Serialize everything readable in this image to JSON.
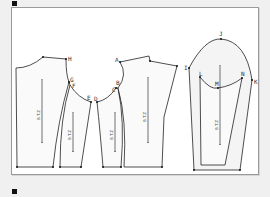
{
  "diagram": {
    "type": "sewing-pattern",
    "pieces": [
      {
        "name": "back",
        "points": [
          "H"
        ],
        "grain_label": "B.T.Z"
      },
      {
        "name": "side-back",
        "points": [
          "G",
          "F",
          "E"
        ],
        "grain_label": "B.T.Z"
      },
      {
        "name": "side-front",
        "points": [
          "D",
          "C"
        ],
        "grain_label": "B.T.Z"
      },
      {
        "name": "front",
        "points": [
          "A",
          "B"
        ],
        "grain_label": "B.T.Z"
      },
      {
        "name": "sleeve",
        "points": [
          "I",
          "J",
          "K",
          "L",
          "M",
          "N"
        ],
        "grain_label": "B.T.Z"
      }
    ],
    "labels": {
      "A": "A",
      "B": "B",
      "C": "C",
      "D": "D",
      "E": "E",
      "F": "F",
      "G": "G",
      "H": "H",
      "I": "I",
      "J": "J",
      "K": "K",
      "L": "L",
      "M": "M",
      "N": "N"
    },
    "grain_text": "B.T.Z",
    "colors": {
      "line": "#222222",
      "background": "#ffffff",
      "page": "#f0f0f0",
      "sleeve_fill": "#f4f4f4"
    }
  }
}
